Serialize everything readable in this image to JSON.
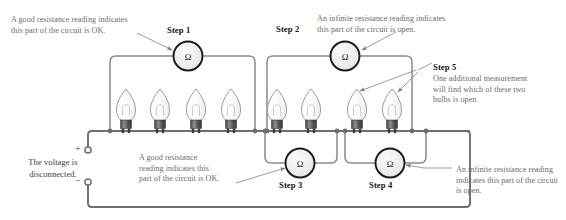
{
  "figure": {
    "ohm_symbol": "Ω",
    "wire_color": "#6e6e6e",
    "meter_fill": "#ededed",
    "meter_stroke": "#1a1a1a",
    "text_color": "#6b6b6b",
    "step_color": "#141414"
  },
  "annotations": {
    "top_left": "A good resistance reading indicates\nthis part of the circuit is OK.",
    "top_right": "An infinite resistance reading indicates\nthis part of the circuit is open.",
    "step5_body": "One additional measurement\nwill find which of these two\nbulbs is open.",
    "bottom_mid": "A good resistance\nreading indicates this\npart of the circuit is OK.",
    "bottom_right": "An infinite resistance reading\nindicates this part of the circuit\nis open.",
    "voltage": "The voltage is\ndisconnected."
  },
  "steps": [
    {
      "id": "step1",
      "label": "Step 1"
    },
    {
      "id": "step2",
      "label": "Step 2"
    },
    {
      "id": "step3",
      "label": "Step 3"
    },
    {
      "id": "step4",
      "label": "Step 4"
    },
    {
      "id": "step5",
      "label": "Step 5"
    }
  ],
  "terminals": {
    "positive": "+",
    "negative": "−"
  },
  "meters": [
    {
      "name": "ohmmeter-step1",
      "cx": 188,
      "cy": 56
    },
    {
      "name": "ohmmeter-step2",
      "cx": 345,
      "cy": 56
    },
    {
      "name": "ohmmeter-step3",
      "cx": 300,
      "cy": 163
    },
    {
      "name": "ohmmeter-step4",
      "cx": 390,
      "cy": 163
    }
  ],
  "bulbs": [
    {
      "name": "bulb-1",
      "x": 126
    },
    {
      "name": "bulb-2",
      "x": 160
    },
    {
      "name": "bulb-3",
      "x": 196
    },
    {
      "name": "bulb-4",
      "x": 231
    },
    {
      "name": "bulb-5",
      "x": 277
    },
    {
      "name": "bulb-6",
      "x": 311
    },
    {
      "name": "bulb-7",
      "x": 357
    },
    {
      "name": "bulb-8",
      "x": 392
    }
  ]
}
